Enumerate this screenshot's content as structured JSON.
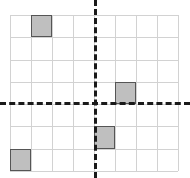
{
  "figure": {
    "title": "",
    "type": "coordinate-grid-with-shaded-cells",
    "background_color": "#ffffff"
  },
  "chart_data": {
    "type": "scatter",
    "title": "",
    "xlabel": "",
    "ylabel": "",
    "grid": true,
    "legend": false,
    "grid_columns": 8,
    "grid_rows": 7,
    "xlim": [
      -4,
      4
    ],
    "ylim": [
      -3,
      4
    ],
    "axis_style": "dashed",
    "axis_color": "#1a1a1a",
    "gridline_color": "#d2d2d2",
    "cell_fill_color": "#bfbfbf",
    "cell_border_color": "#555555",
    "x": [
      -3,
      1,
      0,
      -4
    ],
    "y": [
      3,
      0,
      -1,
      -3
    ],
    "categories": [
      "square-1",
      "square-2",
      "square-3",
      "square-4"
    ],
    "values": [
      1,
      1,
      1,
      1
    ],
    "shaded_cells": [
      {
        "label": "square-1",
        "col": 1,
        "row": 0,
        "x": -3,
        "y": 3
      },
      {
        "label": "square-2",
        "col": 5,
        "row": 3,
        "x": 1,
        "y": 0
      },
      {
        "label": "square-3",
        "col": 4,
        "row": 5,
        "x": 0,
        "y": -2
      },
      {
        "label": "square-4",
        "col": 0,
        "row": 6,
        "x": -4,
        "y": -3
      }
    ],
    "vertical_gridline_positions": [
      0,
      21,
      42,
      63,
      84,
      105,
      126,
      147,
      168
    ],
    "horizontal_gridline_positions": [
      0,
      22.3,
      44.6,
      66.9,
      89.1,
      111.4,
      133.7,
      156
    ],
    "x_axis_pixel_y": 87,
    "y_axis_pixel_x": 84
  }
}
